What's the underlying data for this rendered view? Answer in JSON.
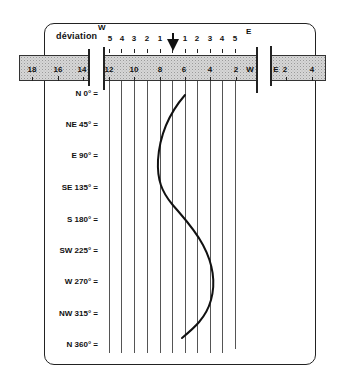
{
  "header": {
    "deviation_label": "déviation",
    "west_letter": "W",
    "east_letter": "E",
    "deviation_scale": [
      "5",
      "4",
      "3",
      "2",
      "1",
      "1",
      "2",
      "3",
      "4",
      "5"
    ],
    "pointer": "arrow-down"
  },
  "strip": {
    "left_segment": [
      "18",
      "16",
      "14"
    ],
    "middle_segment": [
      "12",
      "10",
      "8",
      "6",
      "4",
      "2",
      "W"
    ],
    "right_segment": [
      "E",
      "2",
      "4"
    ]
  },
  "headings": [
    {
      "label": "N 0° ="
    },
    {
      "label": "NE 45° ="
    },
    {
      "label": "E 90° ="
    },
    {
      "label": "SE 135° ="
    },
    {
      "label": "S 180° ="
    },
    {
      "label": "SW 225° ="
    },
    {
      "label": "W 270° ="
    },
    {
      "label": "NW 315° ="
    },
    {
      "label": "N 360° ="
    }
  ],
  "curve": {
    "description": "sinusoidal deviation curve across headings 0°–360°",
    "color": "#111111"
  }
}
